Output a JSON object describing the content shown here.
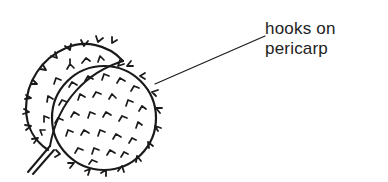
{
  "diagram": {
    "label": {
      "line1": "hooks on",
      "line2": "pericarp"
    },
    "colors": {
      "ink": "#1a1a1a",
      "background": "#ffffff"
    }
  }
}
